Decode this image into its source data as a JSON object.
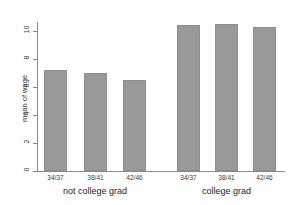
{
  "figure": {
    "top_clipped_text": "",
    "background": "#fefefe",
    "panel_background": "#ffffff",
    "bar_color": "#999999",
    "axis_color": "#8a8a8a"
  },
  "chart_data": {
    "type": "bar",
    "title": "",
    "xlabel": "",
    "ylabel": "mean of wage",
    "ylim": [
      0,
      11
    ],
    "yticks": [
      "0",
      "2",
      "4",
      "6",
      "8",
      "10"
    ],
    "ytick_values": [
      0,
      2,
      4,
      6,
      8,
      10
    ],
    "grid": false,
    "legend": "none",
    "groups": [
      {
        "label": "not college grad",
        "categories": [
          "34/37",
          "38/41",
          "42/46"
        ],
        "values": [
          7.2,
          7.0,
          6.5
        ]
      },
      {
        "label": "college grad",
        "categories": [
          "34/37",
          "38/41",
          "42/46"
        ],
        "values": [
          10.45,
          10.5,
          10.3
        ]
      }
    ],
    "categories": [
      "34/37",
      "38/41",
      "42/46",
      "34/37",
      "38/41",
      "42/46"
    ],
    "values": [
      7.2,
      7.0,
      6.5,
      10.45,
      10.5,
      10.3
    ]
  }
}
